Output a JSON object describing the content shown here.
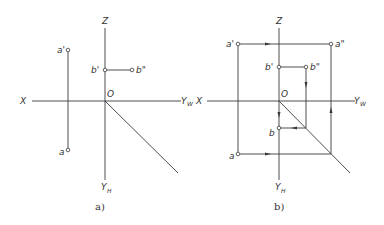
{
  "figures": [
    {
      "id": "a",
      "caption": "a)",
      "axes": {
        "x": "X",
        "z": "Z",
        "origin": "O",
        "y_w": "Y",
        "y_w_sub": "W",
        "y_h": "Y",
        "y_h_sub": "H"
      },
      "points": {
        "a_prime": "a'",
        "a": "a",
        "b_prime": "b'",
        "b_dprime": "b\""
      }
    },
    {
      "id": "b",
      "caption": "b)",
      "axes": {
        "x": "X",
        "z": "Z",
        "origin": "O",
        "y_w": "Y",
        "y_w_sub": "W",
        "y_h": "Y",
        "y_h_sub": "H"
      },
      "points": {
        "a_prime": "a'",
        "a_dprime": "a\"",
        "a": "a",
        "b_prime": "b'",
        "b_dprime": "b\"",
        "b": "b"
      }
    }
  ],
  "colors": {
    "line": "#3a3a3a",
    "background": "#ffffff"
  }
}
